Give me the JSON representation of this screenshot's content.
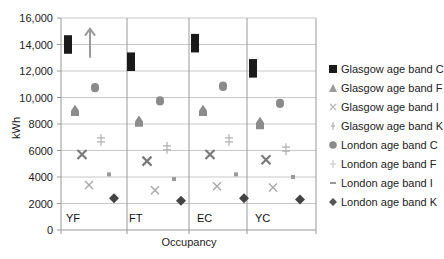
{
  "chart_data": {
    "type": "scatter",
    "title": "",
    "xlabel": "Occupancy",
    "ylabel": "kWh",
    "ylim": [
      0,
      16000
    ],
    "yticks": [
      0,
      2000,
      4000,
      6000,
      8000,
      10000,
      12000,
      14000,
      16000
    ],
    "ytick_labels": [
      "0",
      "2000",
      "4000",
      "6000",
      "8000",
      "10,000",
      "12,000",
      "14,000",
      "16,000"
    ],
    "grid": true,
    "legend_position": "right",
    "categories": [
      "YF",
      "FT",
      "EC",
      "YC"
    ],
    "series": [
      {
        "name": "Glasgow age band C",
        "marker": "square",
        "color": "#1a1a1a",
        "values": [
          14000,
          12700,
          14100,
          12200
        ],
        "ranges": [
          [
            13300,
            14700
          ],
          [
            12000,
            13400
          ],
          [
            13400,
            14800
          ],
          [
            11500,
            12900
          ]
        ]
      },
      {
        "name": "Glasgow age band F",
        "marker": "triangle",
        "color": "#8c8c8c",
        "values": [
          8900,
          8100,
          8900,
          8000
        ],
        "ranges": [
          [
            8600,
            9300
          ],
          [
            7800,
            8500
          ],
          [
            8600,
            9300
          ],
          [
            7600,
            8400
          ]
        ]
      },
      {
        "name": "Glasgow age band I",
        "marker": "x",
        "color": "#7a7a7a",
        "values": [
          5700,
          5200,
          5700,
          5300
        ]
      },
      {
        "name": "Glasgow age band K",
        "marker": "x-light",
        "color": "#a8a8a8",
        "values": [
          3400,
          3000,
          3300,
          3200
        ]
      },
      {
        "name": "London age band C",
        "marker": "circle",
        "color": "#8a8a8a",
        "values": [
          10800,
          9700,
          10900,
          9600
        ],
        "ranges": [
          [
            10400,
            11100
          ],
          [
            9400,
            10100
          ],
          [
            10500,
            11200
          ],
          [
            9200,
            9900
          ]
        ]
      },
      {
        "name": "London age band F",
        "marker": "plus",
        "color": "#b0b0b0",
        "values": [
          6800,
          6200,
          6800,
          6100
        ]
      },
      {
        "name": "London age band I",
        "marker": "dash",
        "color": "#9a9a9a",
        "values": [
          4200,
          3850,
          4200,
          4000
        ]
      },
      {
        "name": "London age band K",
        "marker": "diamond",
        "color": "#444444",
        "values": [
          2400,
          2200,
          2400,
          2300
        ]
      }
    ],
    "annotations": [
      {
        "type": "arrow",
        "direction": "up",
        "panel": "YF",
        "from": 13000,
        "to": 15200,
        "color": "#9a9a9a"
      }
    ]
  },
  "axis": {
    "y_label": "kWh",
    "x_label": "Occupancy",
    "y_ticks": [
      "16,000",
      "14,000",
      "12,000",
      "10,000",
      "8000",
      "6000",
      "4000",
      "2000",
      "0"
    ]
  },
  "panels": [
    "YF",
    "FT",
    "EC",
    "YC"
  ],
  "legend": [
    {
      "label": "Glasgow age band C",
      "marker": "square",
      "color": "#1a1a1a"
    },
    {
      "label": "Glasgow age band F",
      "marker": "triangle",
      "color": "#9a9a9a"
    },
    {
      "label": "Glasgow age band I",
      "marker": "x",
      "color": "#bbbbbb"
    },
    {
      "label": "Glasgow age band K",
      "marker": "bar",
      "color": "#bbbbbb"
    },
    {
      "label": "London age band C",
      "marker": "circle",
      "color": "#8a8a8a"
    },
    {
      "label": "London age band F",
      "marker": "plus",
      "color": "#c0c0c0"
    },
    {
      "label": "London age band I",
      "marker": "dash",
      "color": "#999999"
    },
    {
      "label": "London age band K",
      "marker": "diamond",
      "color": "#555555"
    }
  ]
}
